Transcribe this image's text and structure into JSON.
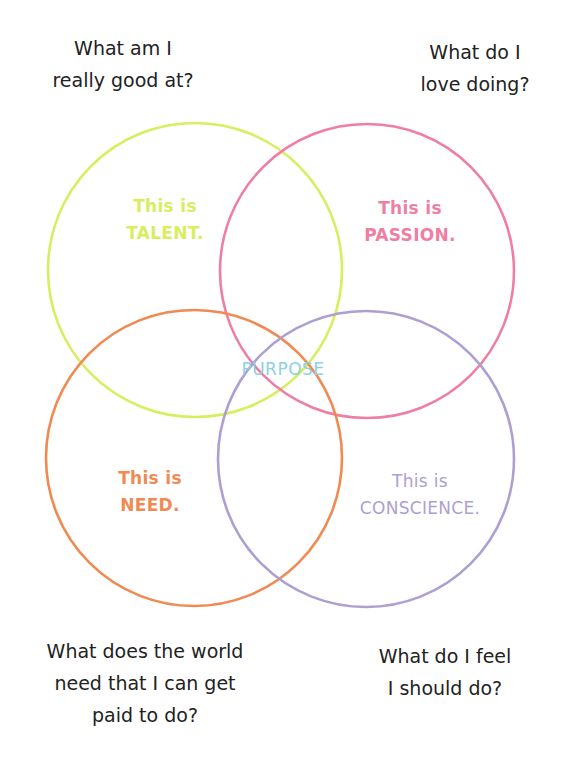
{
  "diagram": {
    "type": "venn",
    "colors": {
      "talent": "#d8ee5e",
      "passion": "#ef7fa2",
      "need": "#f08a52",
      "conscience": "#ad9fd2",
      "purpose": "#8ed0e4",
      "question_text": "#222222"
    },
    "circles": [
      {
        "name": "talent",
        "cx": 195,
        "cy": 270,
        "r": 147
      },
      {
        "name": "passion",
        "cx": 367,
        "cy": 271,
        "r": 147
      },
      {
        "name": "need",
        "cx": 194,
        "cy": 458,
        "r": 148
      },
      {
        "name": "conscience",
        "cx": 366,
        "cy": 459,
        "r": 148
      }
    ],
    "questions": {
      "talent": {
        "lines": [
          "What am I",
          "really good at?"
        ]
      },
      "passion": {
        "lines": [
          "What do I",
          "love doing?"
        ]
      },
      "need": {
        "lines": [
          "What does the world",
          "need that I can get",
          "paid to do?"
        ]
      },
      "conscience": {
        "lines": [
          "What do I feel",
          "I should do?"
        ]
      }
    },
    "labels": {
      "talent": {
        "lines": [
          "This is",
          "TALENT."
        ]
      },
      "passion": {
        "lines": [
          "This is",
          "PASSION."
        ]
      },
      "need": {
        "lines": [
          "This is",
          "NEED."
        ]
      },
      "conscience": {
        "lines": [
          "This is",
          "CONSCIENCE."
        ]
      },
      "center": "PURPOSE"
    }
  }
}
